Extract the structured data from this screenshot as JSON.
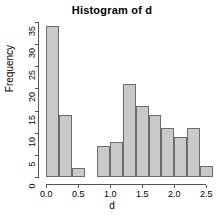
{
  "chart_data": {
    "type": "bar",
    "title": "Histogram of d",
    "xlabel": "d",
    "ylabel": "Frequency",
    "xlim": [
      -0.05,
      2.62
    ],
    "ylim": [
      0,
      36
    ],
    "grid": false,
    "legend": null,
    "bin_width": 0.2,
    "bin_edges": [
      0.0,
      0.2,
      0.4,
      0.6,
      0.8,
      1.0,
      1.2,
      1.4,
      1.6,
      1.8,
      2.0,
      2.2,
      2.4,
      2.6
    ],
    "categories": [
      "0.0-0.2",
      "0.2-0.4",
      "0.4-0.6",
      "0.6-0.8",
      "0.8-1.0",
      "1.0-1.2",
      "1.2-1.4",
      "1.4-1.6",
      "1.6-1.8",
      "1.8-2.0",
      "2.0-2.2",
      "2.2-2.4",
      "2.4-2.6"
    ],
    "values": [
      34,
      14,
      2,
      0,
      7,
      8,
      21,
      16,
      14,
      11,
      9,
      11,
      2.5
    ],
    "xticks": [
      0.0,
      0.5,
      1.0,
      1.5,
      2.0,
      2.5
    ],
    "xtick_labels": [
      "0.0",
      "0.5",
      "1.0",
      "1.5",
      "2.0",
      "2.5"
    ],
    "yticks": [
      0,
      5,
      10,
      15,
      20,
      25,
      30,
      35
    ],
    "ytick_labels": [
      "0",
      "5",
      "10",
      "15",
      "20",
      "25",
      "30",
      "35"
    ],
    "bar_fill": "#c9c9c9",
    "bar_border": "#6b6b6b",
    "axis_color": "#555555"
  }
}
